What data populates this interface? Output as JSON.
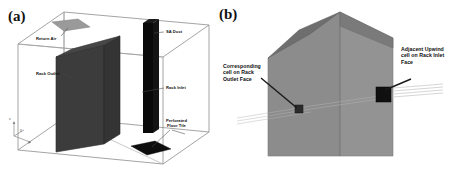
{
  "figure": {
    "panels": [
      {
        "id": "a",
        "label": "(a)",
        "description": "Data center room enclosure schematic with rack, supply air duct, return air vent and perforated floor tile",
        "callouts": [
          {
            "name": "return-air",
            "text": "Return Air"
          },
          {
            "name": "sa-duct",
            "text": "SA Duct"
          },
          {
            "name": "rack-outlet",
            "text": "Rack Outlet"
          },
          {
            "name": "rack-inlet",
            "text": "Rack Inlet"
          },
          {
            "name": "perforated-floor-tile",
            "text": "Perforated\nFloor Tile"
          }
        ],
        "axes": {
          "x": "x",
          "y": "y",
          "z": "z"
        }
      },
      {
        "id": "b",
        "label": "(b)",
        "description": "Close-up view of rack showing corresponding cell on rack outlet face and adjacent upwind cell on rack inlet face",
        "callouts": [
          {
            "name": "corresponding-cell-outlet",
            "text": "Corresponding\ncell on Rack\nOutlet Face"
          },
          {
            "name": "adjacent-upwind-cell-inlet",
            "text": "Adjacent Upwind\ncell on Rack Inlet\nFace"
          }
        ]
      }
    ]
  },
  "colors": {
    "rack_body": "#3c3c3c",
    "sa_duct": "#0a0a0a",
    "floor_tile": "#0d0d0d",
    "return_air_tile": "#9a9a9a",
    "room_outline": "#8d8d8d",
    "panel_b_face": "#8a8a8a",
    "panel_b_top": "#6e6e6e",
    "panel_b_cell": "#111111",
    "text": "#0d0d0d",
    "background": "#ffffff"
  }
}
